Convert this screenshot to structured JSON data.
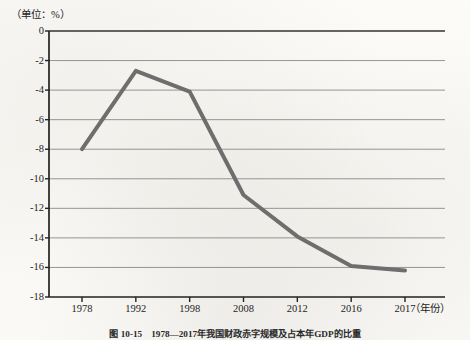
{
  "unit_label": "（单位：%）",
  "x_axis_unit": "（年份）",
  "caption": "图 10-15　1978—2017年我国财政赤字规模及占本年GDP的比重",
  "colors": {
    "line": "#6e6e6e",
    "axis": "#222222",
    "grid": "#8a8a8a",
    "background": "#fbfaf7"
  },
  "chart_data": {
    "type": "line",
    "title": "",
    "subtitle": "",
    "xlabel": "（年份）",
    "ylabel": "（单位：%）",
    "categories": [
      "1978",
      "1992",
      "1998",
      "2008",
      "2012",
      "2016",
      "2017"
    ],
    "values": [
      -8.0,
      -2.7,
      -4.1,
      -11.1,
      -13.9,
      -15.9,
      -16.2
    ],
    "series": [
      {
        "name": "比重",
        "values": [
          -8.0,
          -2.7,
          -4.1,
          -11.1,
          -13.9,
          -15.9,
          -16.2
        ]
      }
    ],
    "ylim": [
      -18,
      0
    ],
    "ytick_labels": [
      "0",
      "-2",
      "-4",
      "-6",
      "-8",
      "-10",
      "-12",
      "-14",
      "-16",
      "-18"
    ],
    "ytick_values": [
      0,
      -2,
      -4,
      -6,
      -8,
      -10,
      -12,
      -14,
      -16,
      -18
    ],
    "xtick_labels": [
      "1978",
      "1992",
      "1998",
      "2008",
      "2012",
      "2016",
      "2017"
    ],
    "grid": true,
    "grid_axis": "y",
    "legend": false,
    "legend_position": "none",
    "markers": false,
    "line_width": 4,
    "line_color": "#6e6e6e"
  }
}
